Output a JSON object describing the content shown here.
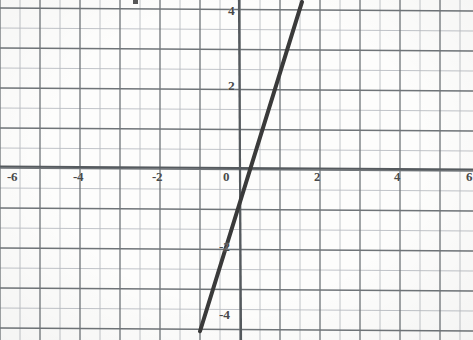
{
  "figure": {
    "kind": "scanned-graph-paper",
    "background_color": "#fdfdfc",
    "minor_grid_color": "#b9bcc2",
    "major_grid_color": "#6f7478",
    "axis_color": "#555a5e",
    "line_color": "#3a3a3a",
    "label_color": "#4a4a4a",
    "partial_glyph_top": ""
  },
  "chart_data": {
    "type": "line",
    "title": "",
    "xlabel": "",
    "ylabel": "",
    "xlim": [
      -6.0,
      6.0
    ],
    "ylim": [
      -4.2,
      4.2
    ],
    "grid": true,
    "minor_grid": true,
    "major_tick_step": 2,
    "minor_tick_step": 0.5,
    "legend": "none",
    "x_tick_labels": [
      "-6",
      "-4",
      "-2",
      "0",
      "2",
      "4",
      "6"
    ],
    "x_tick_values": [
      -6,
      -4,
      -2,
      0,
      2,
      4,
      6
    ],
    "y_tick_labels": [
      "4",
      "2",
      "-2",
      "-4"
    ],
    "y_tick_values": [
      4,
      2,
      -2,
      -4
    ],
    "series": [
      {
        "name": "line",
        "kind": "straight-line",
        "slope": 3.2,
        "intercept": -0.6,
        "x": [
          -1.0,
          1.55
        ],
        "values": [
          -4.05,
          4.2
        ],
        "endpoints": [
          {
            "x": -1.0,
            "y": -4.05
          },
          {
            "x": 1.55,
            "y": 4.2
          }
        ],
        "x_intercept": 0.19,
        "y_intercept": -0.6,
        "color": "#3a3a3a",
        "width_px": 4
      }
    ],
    "annotations": []
  },
  "axes": {
    "x_axis_label": "x",
    "y_axis_label": "y",
    "origin_label": "0"
  },
  "ticks": {
    "x": [
      {
        "label": "-6",
        "value": -6
      },
      {
        "label": "-4",
        "value": -4
      },
      {
        "label": "-2",
        "value": -2
      },
      {
        "label": "0",
        "value": 0
      },
      {
        "label": "2",
        "value": 2
      },
      {
        "label": "4",
        "value": 4
      },
      {
        "label": "6",
        "value": 6
      }
    ],
    "y": [
      {
        "label": "4",
        "value": 4
      },
      {
        "label": "2",
        "value": 2
      },
      {
        "label": "-2",
        "value": -2
      },
      {
        "label": "-4",
        "value": -4
      }
    ]
  }
}
